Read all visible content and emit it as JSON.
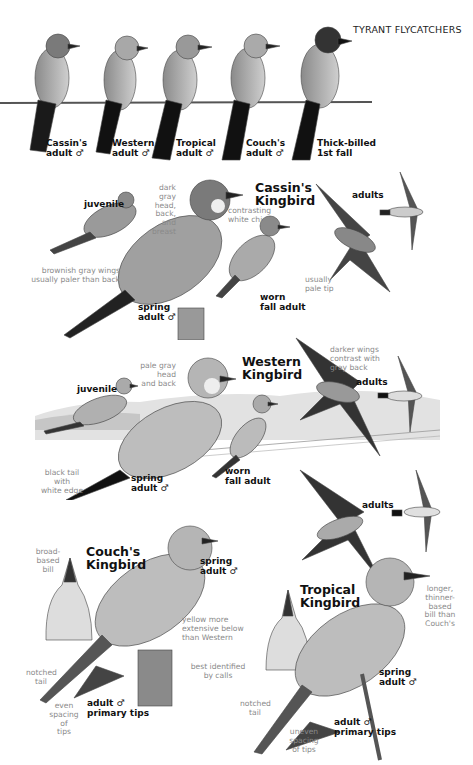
{
  "header": {
    "title": "TYRANT FLYCATCHERS"
  },
  "wire_row": {
    "birds": [
      {
        "species": "Cassin's",
        "label": "adult ♂"
      },
      {
        "species": "Western",
        "label": "adult ♂"
      },
      {
        "species": "Tropical",
        "label": "adult ♂"
      },
      {
        "species": "Couch's",
        "label": "adult ♂"
      },
      {
        "species": "Thick-billed",
        "label": "1st fall"
      }
    ]
  },
  "cassins": {
    "title_line1": "Cassin's",
    "title_line2": "Kingbird",
    "juvenile": "juvenile",
    "note_head": [
      "dark gray",
      "head, back,",
      "and breast"
    ],
    "note_chin": [
      "contrasting",
      "white chin"
    ],
    "note_wings": [
      "brownish gray wings",
      "usually paler than back"
    ],
    "spring_adult": [
      "spring",
      "adult ♂"
    ],
    "worn_fall": [
      "worn",
      "fall adult"
    ],
    "adults": "adults",
    "note_tip": [
      "usually",
      "pale tip"
    ]
  },
  "western": {
    "title_line1": "Western",
    "title_line2": "Kingbird",
    "juvenile": "juvenile",
    "note_head": [
      "pale gray head",
      "and back"
    ],
    "note_wings": [
      "darker wings",
      "contrast with",
      "gray back"
    ],
    "adults": "adults",
    "note_tail": [
      "black tail with",
      "white edge"
    ],
    "spring_adult": [
      "spring",
      "adult ♂"
    ],
    "worn_fall": [
      "worn",
      "fall adult"
    ]
  },
  "couchs": {
    "title_line1": "Couch's",
    "title_line2": "Kingbird",
    "note_bill": [
      "broad-",
      "based",
      "bill"
    ],
    "spring_adult": [
      "spring",
      "adult ♂"
    ],
    "note_yellow": [
      "yellow more",
      "extensive below",
      "than Western"
    ],
    "note_calls": [
      "best identified",
      "by calls"
    ],
    "note_tail": [
      "notched",
      "tail"
    ],
    "note_spacing": [
      "even",
      "spacing of",
      "tips"
    ],
    "primary_tips": [
      "adult ♂",
      "primary tips"
    ]
  },
  "tropical": {
    "title_line1": "Tropical",
    "title_line2": "Kingbird",
    "adults": "adults",
    "note_bill": [
      "longer,",
      "thinner-",
      "based",
      "bill than",
      "Couch's"
    ],
    "spring_adult": [
      "spring",
      "adult ♂"
    ],
    "note_tail": [
      "notched",
      "tail"
    ],
    "note_spacing": [
      "uneven spacing",
      "of tips"
    ],
    "primary_tips": [
      "adult ♂",
      "primary tips"
    ]
  }
}
